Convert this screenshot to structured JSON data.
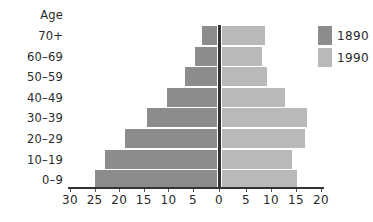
{
  "chart_data": {
    "type": "bar",
    "orientation": "horizontal",
    "subtype": "population-pyramid",
    "title": "",
    "ylabel": "Age",
    "xlabel": "",
    "categories": [
      "70+",
      "60-69",
      "50-59",
      "40-49",
      "30-39",
      "20-29",
      "10-19",
      "0-9"
    ],
    "series": [
      {
        "name": "1890",
        "side": "left",
        "color": "#8c8c8c",
        "values": [
          3,
          4.5,
          6.5,
          10,
          14,
          18.5,
          22.5,
          24.5
        ]
      },
      {
        "name": "1990",
        "side": "right",
        "color": "#b9b9b9",
        "values": [
          8.5,
          8,
          9,
          12.5,
          17,
          16.5,
          14,
          15
        ]
      }
    ],
    "xlim_left": [
      0,
      30
    ],
    "xlim_right": [
      0,
      20
    ],
    "xtick_labels": [
      "30",
      "25",
      "20",
      "15",
      "10",
      "5",
      "0",
      "5",
      "10",
      "15",
      "20"
    ],
    "grid": false,
    "legend_position": "top-right"
  },
  "labels": {
    "age": "Age",
    "categories": [
      "70+",
      "60–69",
      "50–59",
      "40–49",
      "30–39",
      "20–29",
      "10–19",
      "0–9"
    ]
  },
  "ticks": {
    "left": [
      "30",
      "25",
      "20",
      "15",
      "10",
      "5"
    ],
    "zero": "0",
    "right": [
      "5",
      "10",
      "15",
      "20"
    ]
  },
  "legend": {
    "items": [
      {
        "label": "1890",
        "color": "#8c8c8c"
      },
      {
        "label": "1990",
        "color": "#b9b9b9"
      }
    ]
  }
}
